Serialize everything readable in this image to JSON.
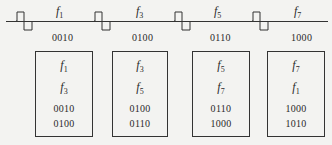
{
  "signal_line": {
    "pulses": [
      {
        "freq_symbol": "f",
        "freq_index": "1",
        "code": "0010"
      },
      {
        "freq_symbol": "f",
        "freq_index": "3",
        "code": "0100"
      },
      {
        "freq_symbol": "f",
        "freq_index": "5",
        "code": "0110"
      },
      {
        "freq_symbol": "f",
        "freq_index": "7",
        "code": "1000"
      }
    ]
  },
  "boxes": [
    {
      "freq_a_symbol": "f",
      "freq_a_index": "1",
      "freq_b_symbol": "f",
      "freq_b_index": "3",
      "code_a": "0010",
      "code_b": "0100"
    },
    {
      "freq_a_symbol": "f",
      "freq_a_index": "3",
      "freq_b_symbol": "f",
      "freq_b_index": "5",
      "code_a": "0100",
      "code_b": "0110"
    },
    {
      "freq_a_symbol": "f",
      "freq_a_index": "5",
      "freq_b_symbol": "f",
      "freq_b_index": "7",
      "code_a": "0110",
      "code_b": "1000"
    },
    {
      "freq_a_symbol": "f",
      "freq_a_index": "7",
      "freq_b_symbol": "f",
      "freq_b_index": "1",
      "code_a": "1000",
      "code_b": "1010"
    }
  ],
  "colors": {
    "background": "#f3f3f1",
    "line": "#333333",
    "text": "#2a2a2a"
  }
}
